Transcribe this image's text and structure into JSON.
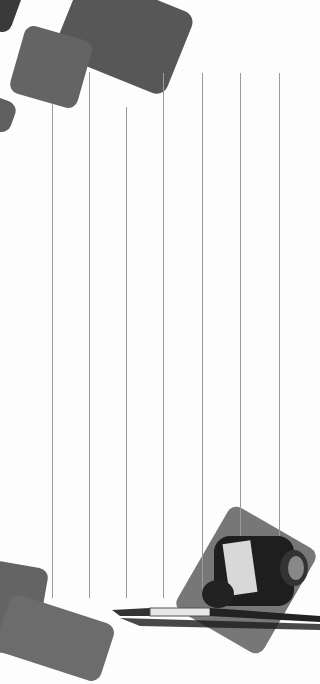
{
  "page": {
    "type": "decorative-notepad-background"
  },
  "colors": {
    "background": "#fdfdfd",
    "shape_dark": "#575757",
    "shape_mid": "#646464",
    "shape_light": "#6c6c6c",
    "line": "#9a9a9a"
  },
  "ruled_lines": [
    {
      "x": 52,
      "top": 104,
      "bottom": 598
    },
    {
      "x": 89,
      "top": 72,
      "bottom": 598
    },
    {
      "x": 126,
      "top": 107,
      "bottom": 598
    },
    {
      "x": 163,
      "top": 73,
      "bottom": 598
    },
    {
      "x": 202,
      "top": 73,
      "bottom": 598
    },
    {
      "x": 240,
      "top": 73,
      "bottom": 598
    },
    {
      "x": 279,
      "top": 73,
      "bottom": 598
    }
  ],
  "illustration": {
    "subject": "ink-bottle-and-fountain-pen"
  }
}
